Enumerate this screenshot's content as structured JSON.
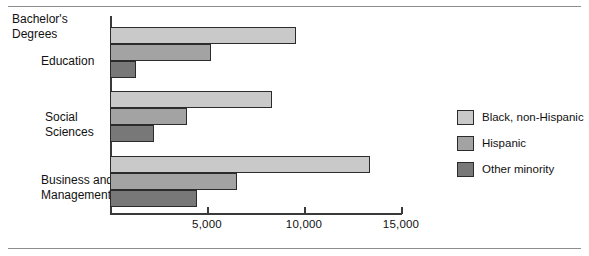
{
  "chart_data": {
    "type": "bar",
    "orientation": "horizontal",
    "title": "Bachelor's Degrees",
    "xlabel": "",
    "ylabel": "",
    "xlim": [
      0,
      15500
    ],
    "grid": false,
    "legend_position": "right",
    "categories": [
      "Education",
      "Social Sciences",
      "Business and Management"
    ],
    "series": [
      {
        "name": "Black, non-Hispanic",
        "color": "#c9c9c9",
        "values": [
          9600,
          8350,
          13400
        ]
      },
      {
        "name": "Hispanic",
        "color": "#a3a3a3",
        "values": [
          5200,
          3950,
          6550
        ]
      },
      {
        "name": "Other minority",
        "color": "#787878",
        "values": [
          1350,
          2250,
          4500
        ]
      }
    ],
    "ticks": [
      {
        "value": 5000,
        "label": "5,000"
      },
      {
        "value": 10000,
        "label": "10,000"
      },
      {
        "value": 15000,
        "label": "15,000"
      }
    ]
  },
  "labels": {
    "group_title_line1": "Bachelor's",
    "group_title_line2": "Degrees",
    "education_line1": "Education",
    "social_line1": "Social",
    "social_line2": "Sciences",
    "business_line1": "Business and",
    "business_line2": "Management"
  },
  "legend": {
    "items": [
      {
        "label": "Black, non-Hispanic",
        "color": "#c9c9c9"
      },
      {
        "label": "Hispanic",
        "color": "#a3a3a3"
      },
      {
        "label": "Other minority",
        "color": "#787878"
      }
    ]
  }
}
